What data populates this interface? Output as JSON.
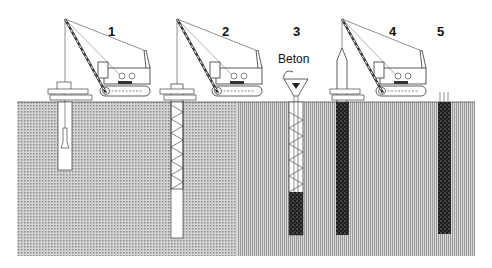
{
  "diagram": {
    "type": "construction-process-sequence",
    "steps": [
      {
        "number": "1",
        "description": "crane drilling borehole with drilling bucket"
      },
      {
        "number": "2",
        "description": "crane lowering reinforcement cage into borehole"
      },
      {
        "number": "3",
        "description": "concrete poured via hopper and tremie pipe"
      },
      {
        "number": "4",
        "description": "crane extracting casing, borehole filled with concrete"
      },
      {
        "number": "5",
        "description": "finished concrete pile"
      }
    ],
    "labels": {
      "step1": "1",
      "step2": "2",
      "step3": "3",
      "step4": "4",
      "step5": "5",
      "concrete": "Beton"
    },
    "colors": {
      "soil": "#b8b8b8",
      "concrete": "#2a2a2a",
      "line": "#333333",
      "background": "#ffffff"
    }
  }
}
